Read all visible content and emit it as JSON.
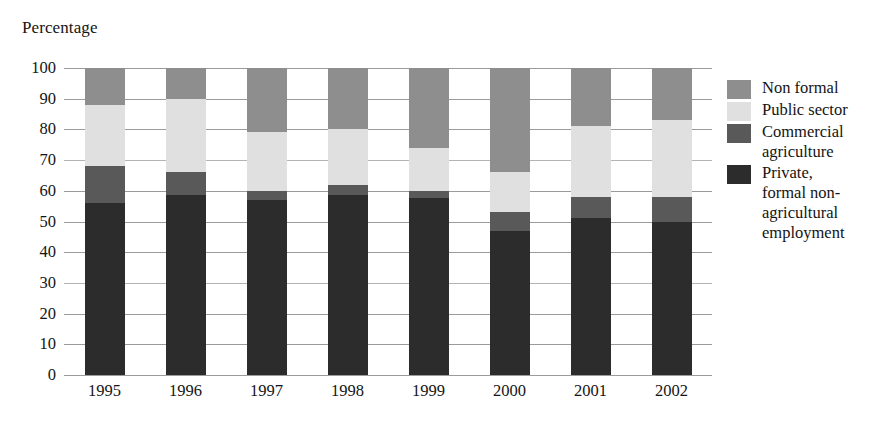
{
  "chart_data": {
    "type": "bar",
    "subtype": "stacked-column",
    "title": "",
    "ylabel": "Percentage",
    "xlabel": "",
    "ylim": [
      0,
      100
    ],
    "ytick_step": 10,
    "yticks": [
      "100",
      "90",
      "80",
      "70",
      "60",
      "50",
      "40",
      "30",
      "20",
      "10",
      "0"
    ],
    "grid": true,
    "grid_axis": "y",
    "legend_position": "right",
    "categories": [
      "1995",
      "1996",
      "1997",
      "1998",
      "1999",
      "2000",
      "2001",
      "2002"
    ],
    "series": [
      {
        "name": "Private, formal non-agricultural employment",
        "legend_label": "Private,\nformal non-\nagricultural\nemployment",
        "color": "#2c2c2c",
        "values": [
          56,
          58.5,
          57,
          58.5,
          57.5,
          47,
          51,
          50
        ]
      },
      {
        "name": "Commercial agriculture",
        "legend_label": "Commercial\nagriculture",
        "color": "#595959",
        "values": [
          12,
          7.5,
          3,
          3.5,
          2.5,
          6,
          7,
          8
        ]
      },
      {
        "name": "Public sector",
        "legend_label": "Public sector",
        "color": "#e0e0e0",
        "values": [
          20,
          24,
          19,
          18,
          14,
          13,
          23,
          25
        ]
      },
      {
        "name": "Non formal",
        "legend_label": "Non formal",
        "color": "#8e8e8e",
        "values": [
          12,
          10,
          21,
          20,
          26,
          34,
          19,
          17
        ]
      }
    ],
    "cumulative_tops": {
      "1995": [
        56,
        68,
        88,
        100
      ],
      "1996": [
        58.5,
        66,
        90,
        100
      ],
      "1997": [
        57,
        60,
        79,
        100
      ],
      "1998": [
        58.5,
        62,
        80,
        100
      ],
      "1999": [
        57.5,
        60,
        74,
        100
      ],
      "2000": [
        47,
        53,
        66,
        100
      ],
      "2001": [
        51,
        58,
        81,
        100
      ],
      "2002": [
        50,
        58,
        83,
        100
      ]
    }
  },
  "legend": {
    "items": [
      {
        "label": "Non formal",
        "color": "#8e8e8e"
      },
      {
        "label": "Public sector",
        "color": "#e0e0e0"
      },
      {
        "label": "Commercial\nagriculture",
        "color": "#595959"
      },
      {
        "label": "Private,\nformal non-\nagricultural\nemployment",
        "color": "#2c2c2c"
      }
    ]
  },
  "axis": {
    "y_title": "Percentage"
  }
}
